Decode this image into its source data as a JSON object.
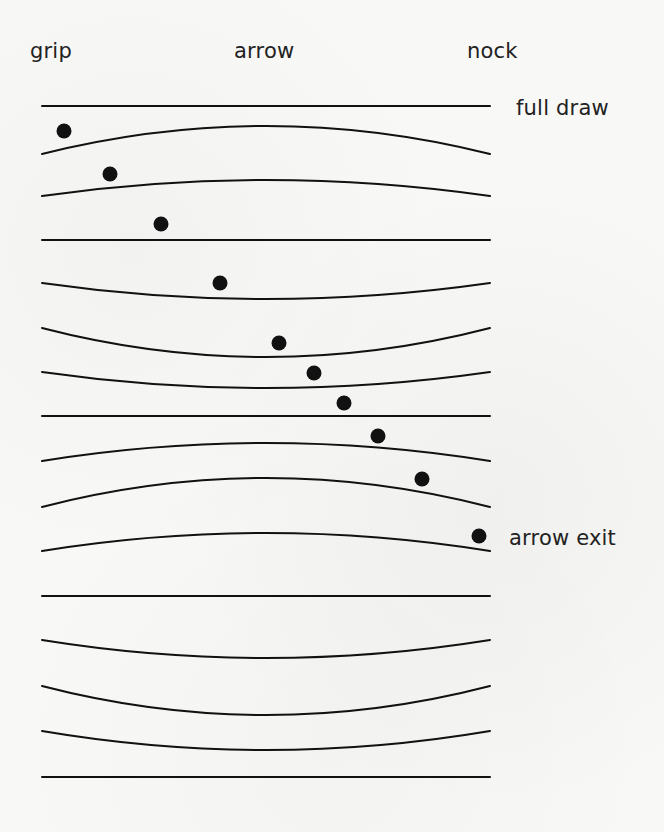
{
  "header_labels": {
    "grip": "grip",
    "arrow": "arrow",
    "nock": "nock"
  },
  "side_labels": {
    "full_draw": "full draw",
    "arrow_exit": "arrow exit"
  },
  "colors": {
    "ink": "#111111",
    "background": "#f8f8f6",
    "text": "#222222"
  },
  "diagram": {
    "line_x_start": 42,
    "line_x_end": 490,
    "dot_radius": 7.5,
    "frames": [
      {
        "end_y": 106,
        "mid_y": 106,
        "shape": "straight"
      },
      {
        "end_y": 154,
        "mid_y": 126,
        "shape": "bow-up"
      },
      {
        "end_y": 196,
        "mid_y": 180,
        "shape": "bow-up"
      },
      {
        "end_y": 240,
        "mid_y": 240,
        "shape": "straight"
      },
      {
        "end_y": 283,
        "mid_y": 299,
        "shape": "bow-down"
      },
      {
        "end_y": 328,
        "mid_y": 357,
        "shape": "bow-down"
      },
      {
        "end_y": 372,
        "mid_y": 388,
        "shape": "bow-down"
      },
      {
        "end_y": 416,
        "mid_y": 416,
        "shape": "straight"
      },
      {
        "end_y": 461,
        "mid_y": 443,
        "shape": "bow-up"
      },
      {
        "end_y": 507,
        "mid_y": 478,
        "shape": "bow-up"
      },
      {
        "end_y": 551,
        "mid_y": 533,
        "shape": "bow-up"
      },
      {
        "end_y": 596,
        "mid_y": 596,
        "shape": "straight"
      },
      {
        "end_y": 640,
        "mid_y": 658,
        "shape": "bow-down"
      },
      {
        "end_y": 686,
        "mid_y": 715,
        "shape": "bow-down"
      },
      {
        "end_y": 731,
        "mid_y": 750,
        "shape": "bow-down"
      },
      {
        "end_y": 777,
        "mid_y": 777,
        "shape": "straight"
      }
    ],
    "dots": [
      {
        "x": 64,
        "y": 131
      },
      {
        "x": 110,
        "y": 174
      },
      {
        "x": 161,
        "y": 224
      },
      {
        "x": 220,
        "y": 283
      },
      {
        "x": 279,
        "y": 343
      },
      {
        "x": 314,
        "y": 373
      },
      {
        "x": 344,
        "y": 403
      },
      {
        "x": 378,
        "y": 436
      },
      {
        "x": 422,
        "y": 479
      },
      {
        "x": 479,
        "y": 536
      }
    ]
  }
}
